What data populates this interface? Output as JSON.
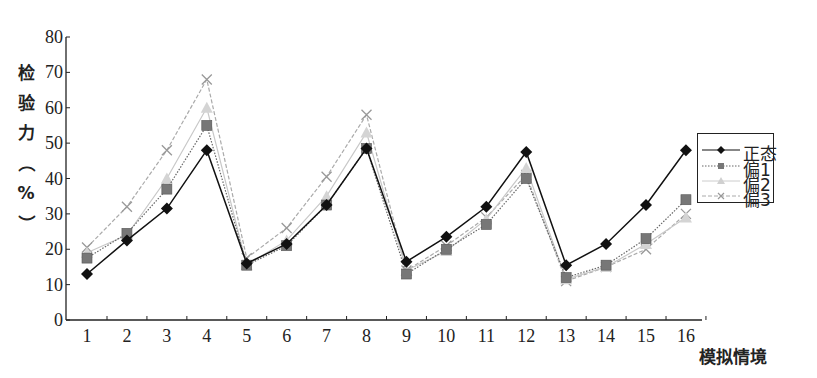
{
  "chart_data": {
    "type": "line",
    "title": "",
    "xlabel": "模拟情境",
    "ylabel": "检验力（%）",
    "ylabel_chars": [
      "检",
      "验",
      "力",
      "（",
      "%",
      "）"
    ],
    "x": [
      1,
      2,
      3,
      4,
      5,
      6,
      7,
      8,
      9,
      10,
      11,
      12,
      13,
      14,
      15,
      16
    ],
    "xticks": [
      "1",
      "2",
      "3",
      "4",
      "5",
      "6",
      "7",
      "8",
      "9",
      "10",
      "11",
      "12",
      "13",
      "14",
      "15",
      "16"
    ],
    "yticks": [
      "0",
      "10",
      "20",
      "30",
      "40",
      "50",
      "60",
      "70",
      "80"
    ],
    "ylim": [
      0,
      80
    ],
    "grid": false,
    "legend_position": "right",
    "series": [
      {
        "name": "正态",
        "marker": "diamond",
        "color": "#111111",
        "dash": "solid",
        "values": [
          13,
          22.5,
          31.5,
          48,
          16,
          21.5,
          32.5,
          48.5,
          16.5,
          23.5,
          32,
          47.5,
          15.5,
          21.5,
          32.5,
          48
        ]
      },
      {
        "name": "偏1",
        "marker": "square",
        "color": "#666666",
        "dash": "dotted",
        "values": [
          17.5,
          24.5,
          37,
          55,
          15.5,
          21,
          32.5,
          48.5,
          13,
          20,
          27,
          40,
          12,
          15.5,
          23,
          34
        ]
      },
      {
        "name": "偏2",
        "marker": "triangle",
        "color": "#c8c8c8",
        "dash": "solid",
        "values": [
          19,
          24,
          40,
          60,
          15.5,
          22.5,
          35,
          53,
          14,
          19.5,
          28.5,
          43,
          11.5,
          15,
          21.5,
          29
        ]
      },
      {
        "name": "偏3",
        "marker": "x",
        "color": "#aaaaaa",
        "dash": "dashed",
        "values": [
          20.5,
          32,
          48,
          68,
          17.5,
          26,
          40.5,
          58,
          14,
          21,
          29,
          41,
          11,
          15,
          20,
          30
        ]
      }
    ]
  }
}
